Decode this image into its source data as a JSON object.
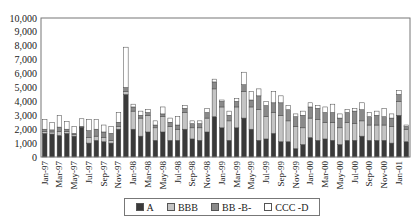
{
  "chart_data": {
    "type": "bar",
    "stacked": true,
    "title": "",
    "xlabel": "",
    "ylabel": "",
    "ylim": [
      0,
      10000
    ],
    "yticks": [
      0,
      1000,
      2000,
      3000,
      4000,
      5000,
      6000,
      7000,
      8000,
      9000,
      10000
    ],
    "ytick_labels": [
      "0",
      "1,000",
      "2,000",
      "3,000",
      "4,000",
      "5,000",
      "6,000",
      "7,000",
      "8,000",
      "9,000",
      "10,000"
    ],
    "grid": false,
    "legend_position": "bottom",
    "categories": [
      "Jan-97",
      "Feb-97",
      "Mar-97",
      "Apr-97",
      "May-97",
      "Jun-97",
      "Jul-97",
      "Aug-97",
      "Sep-97",
      "Oct-97",
      "Nov-97",
      "Dec-97",
      "Jan-98",
      "Feb-98",
      "Mar-98",
      "Apr-98",
      "May-98",
      "Jun-98",
      "Jul-98",
      "Aug-98",
      "Sep-98",
      "Oct-98",
      "Nov-98",
      "Dec-98",
      "Jan-99",
      "Feb-99",
      "Mar-99",
      "Apr-99",
      "May-99",
      "Jun-99",
      "Jul-99",
      "Aug-99",
      "Sep-99",
      "Oct-99",
      "Nov-99",
      "Dec-99",
      "Jan-00",
      "Feb-00",
      "Mar-00",
      "Apr-00",
      "May-00",
      "Jun-00",
      "Jul-00",
      "Aug-00",
      "Sep-00",
      "Oct-00",
      "Nov-00",
      "Dec-00",
      "Jan-01",
      "Feb-01"
    ],
    "xtick_labels": [
      "Jan-97",
      "Mar-97",
      "May-97",
      "Jul-97",
      "Sep-97",
      "Nov-97",
      "Jan-98",
      "Mar-98",
      "May-98",
      "Jul-98",
      "Sep-98",
      "Nov-98",
      "Jan-99",
      "Mar-99",
      "May-99",
      "Jul-99",
      "Sep-99",
      "Nov-99",
      "Jan-00",
      "Mar-00",
      "May-00",
      "Jul-00",
      "Sep-00",
      "Nov-00",
      "Jan-01"
    ],
    "series": [
      {
        "name": "A",
        "color": "#3a3a3a",
        "values": [
          1700,
          1650,
          1550,
          1700,
          1500,
          2100,
          1000,
          1200,
          1100,
          1000,
          2000,
          4500,
          2000,
          1500,
          1800,
          1200,
          1800,
          1200,
          1200,
          2000,
          1300,
          1200,
          1800,
          2900,
          2100,
          1200,
          2100,
          2800,
          2000,
          1200,
          1300,
          1700,
          1100,
          1100,
          600,
          900,
          1400,
          1200,
          1300,
          1200,
          900,
          1200,
          1200,
          1500,
          1200,
          1200,
          1200,
          1000,
          3000,
          1100
        ]
      },
      {
        "name": "BBB",
        "color": "#c4c4c4",
        "values": [
          150,
          150,
          300,
          150,
          100,
          50,
          400,
          300,
          300,
          200,
          200,
          200,
          1300,
          1300,
          1200,
          900,
          1100,
          1000,
          800,
          1200,
          800,
          900,
          1000,
          2000,
          1500,
          1400,
          1500,
          1900,
          1600,
          2200,
          1600,
          1500,
          1900,
          1500,
          1600,
          1200,
          1400,
          1500,
          1200,
          1300,
          1200,
          1300,
          1200,
          1100,
          1100,
          1100,
          1100,
          1200,
          1000,
          900
        ]
      },
      {
        "name": "BB -B-",
        "color": "#8a8a8a",
        "values": [
          150,
          150,
          300,
          150,
          100,
          50,
          500,
          500,
          400,
          500,
          300,
          300,
          300,
          200,
          200,
          200,
          200,
          300,
          300,
          300,
          300,
          300,
          400,
          500,
          400,
          400,
          400,
          500,
          500,
          1000,
          800,
          700,
          900,
          800,
          700,
          900,
          800,
          800,
          700,
          700,
          700,
          700,
          900,
          800,
          600,
          700,
          600,
          600,
          500,
          200
        ]
      },
      {
        "name": "CCC -D",
        "color": "#ffffff",
        "values": [
          700,
          550,
          850,
          550,
          500,
          550,
          800,
          700,
          500,
          500,
          700,
          2900,
          200,
          300,
          200,
          300,
          500,
          300,
          600,
          200,
          200,
          200,
          300,
          200,
          100,
          300,
          200,
          900,
          600,
          500,
          300,
          800,
          500,
          300,
          200,
          300,
          300,
          200,
          400,
          600,
          300,
          200,
          200,
          500,
          300,
          300,
          600,
          300,
          300,
          100
        ]
      }
    ]
  },
  "legend": {
    "items": [
      {
        "label": "A",
        "color": "#3a3a3a"
      },
      {
        "label": "BBB",
        "color": "#c4c4c4"
      },
      {
        "label": "BB -B-",
        "color": "#8a8a8a"
      },
      {
        "label": "CCC -D",
        "color": "#ffffff"
      }
    ]
  }
}
